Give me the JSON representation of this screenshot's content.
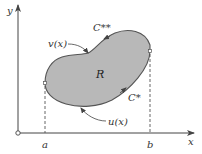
{
  "figure": {
    "type": "region-between-curves",
    "axes": {
      "x_label": "x",
      "y_label": "y",
      "origin_marker": "open-circle"
    },
    "bounds": {
      "left_label": "a",
      "right_label": "b"
    },
    "region": {
      "label": "R",
      "fill_color": "#b8b8b8",
      "outline_color": "#555555"
    },
    "curves": {
      "upper_function": "v(x)",
      "lower_function": "u(x)",
      "upper_path": "C**",
      "lower_path": "C*"
    }
  }
}
